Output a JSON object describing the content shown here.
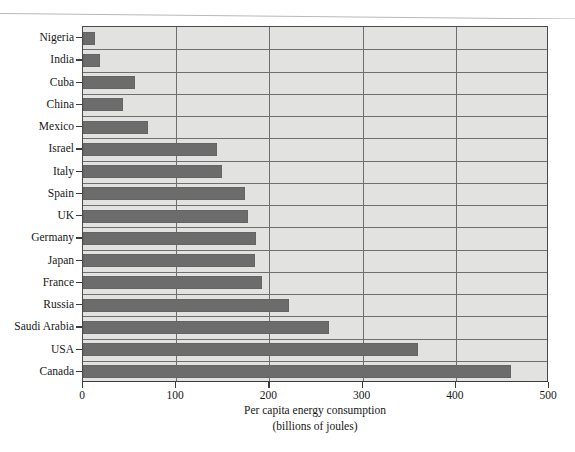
{
  "chart_data": {
    "type": "bar",
    "orientation": "horizontal",
    "title": "",
    "xlabel": "Per capita energy consumption",
    "xlabel_units": "(billions of joules)",
    "ylabel": "",
    "xlim": [
      0,
      500
    ],
    "xticks": [
      0,
      100,
      200,
      300,
      400,
      500
    ],
    "xticklabels": [
      "0",
      "100",
      "200",
      "300",
      "400",
      "500"
    ],
    "grid": "both",
    "legend": "none",
    "categories": [
      "Nigeria",
      "India",
      "Cuba",
      "China",
      "Mexico",
      "Israel",
      "Italy",
      "Spain",
      "UK",
      "Germany",
      "Japan",
      "France",
      "Russia",
      "Saudi Arabia",
      "USA",
      "Canada"
    ],
    "values": [
      13,
      18,
      56,
      43,
      70,
      144,
      149,
      174,
      177,
      186,
      185,
      192,
      221,
      264,
      359,
      459
    ],
    "bar_color": "#6c6c6c",
    "plot_background": "#e2e2e0",
    "grid_color": "#6f6f6f",
    "axis_color": "#3c3c3c"
  }
}
